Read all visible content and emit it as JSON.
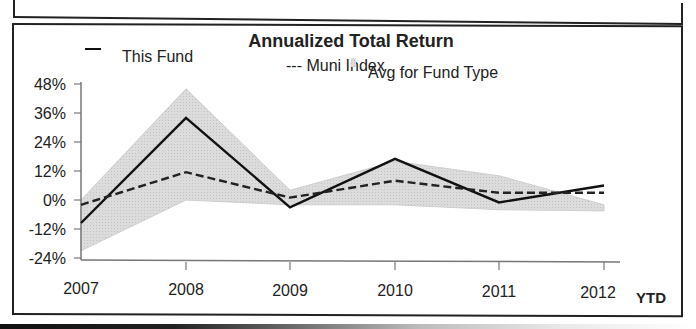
{
  "chart_data": {
    "type": "line",
    "title": "Annualized Total Return",
    "xlabel": "",
    "ylabel": "",
    "categories": [
      "2007",
      "2008",
      "2009",
      "2010",
      "2011",
      "2012"
    ],
    "x_suffix_label": "YTD",
    "y_ticks": [
      "48%",
      "36%",
      "24%",
      "12%",
      "0%",
      "-12%",
      "-24%"
    ],
    "ylim": [
      -24,
      48
    ],
    "grid": false,
    "legend_position": "top",
    "series": [
      {
        "name": "This Fund",
        "style": "solid",
        "values": [
          -9.5,
          34,
          -3,
          17,
          -1,
          6
        ]
      },
      {
        "name": "Muni Index",
        "style": "dashed",
        "values": [
          -2,
          11.5,
          1,
          8,
          3,
          3
        ]
      },
      {
        "name": "Avg for Fund Type",
        "style": "band",
        "upper": [
          0,
          46,
          4,
          16,
          10,
          -2
        ],
        "lower": [
          -21,
          0,
          -2,
          -2,
          -4,
          -4.5
        ]
      }
    ]
  },
  "legend": {
    "fund_marker": "—",
    "fund_label": "This Fund",
    "index_label": "--- Muni Index",
    "avg_label": "Avg for Fund Type"
  },
  "colors": {
    "fund": "#111111",
    "index": "#222222",
    "band": "#d9d9d9",
    "axis": "#777777"
  }
}
